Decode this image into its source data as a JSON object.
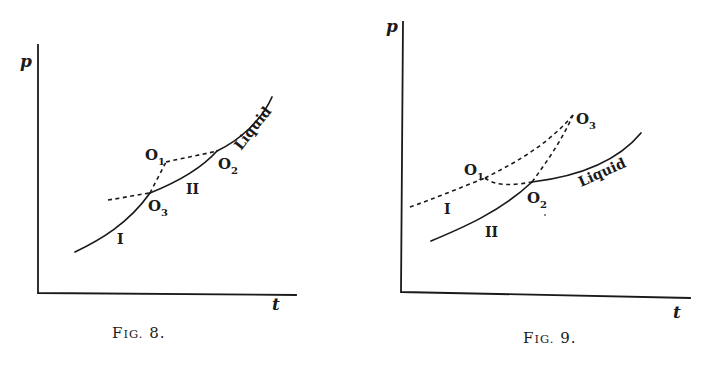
{
  "figures": [
    {
      "id": "fig8",
      "caption": {
        "prefix": "F",
        "small": "IG.",
        "number": " 8."
      },
      "axes": {
        "y_label": "p",
        "x_label": "t"
      },
      "points": {
        "O1": {
          "letter": "O",
          "sub": "1"
        },
        "O2": {
          "letter": "O",
          "sub": "2"
        },
        "O3": {
          "letter": "O",
          "sub": "3"
        }
      },
      "curve_labels": {
        "I": "I",
        "II": "II",
        "liquid": "Liquid"
      }
    },
    {
      "id": "fig9",
      "caption": {
        "prefix": "F",
        "small": "IG.",
        "number": " 9."
      },
      "axes": {
        "y_label": "p",
        "x_label": "t"
      },
      "points": {
        "O1": {
          "letter": "O",
          "sub": "1"
        },
        "O2": {
          "letter": "O",
          "sub": "2"
        },
        "O3": {
          "letter": "O",
          "sub": "3"
        }
      },
      "curve_labels": {
        "I": "I",
        "II": "II",
        "liquid": "Liquid"
      }
    }
  ],
  "colors": {
    "ink": "#1a1a1a",
    "paper": "#ffffff"
  }
}
